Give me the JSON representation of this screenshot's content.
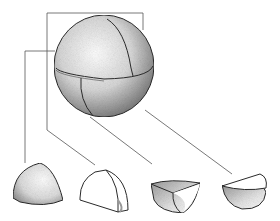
{
  "figure": {
    "description": "Line illustration of a sphere divided into four quadrant segments, with leader lines pointing to each separated segment below",
    "colors": {
      "background": "#ffffff",
      "ink": "#2a2a2a",
      "leader_line": "#555555",
      "stipple_shadow": "#6e6e6e"
    },
    "whole_sphere": {
      "label": "",
      "segments": 4
    },
    "pieces": [
      {
        "label": "",
        "shape": "dome-quarter-shaded"
      },
      {
        "label": "",
        "shape": "quarter-with-cut-face"
      },
      {
        "label": "",
        "shape": "hollow-quarter-top-view"
      },
      {
        "label": "",
        "shape": "half-bowl"
      }
    ]
  }
}
